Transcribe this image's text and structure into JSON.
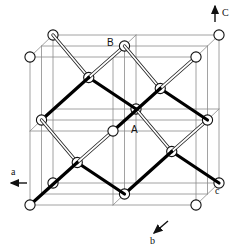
{
  "figure": {
    "kind": "crystal-structure-diagram",
    "background_color": "#ffffff",
    "atom_fill": "#ffffff",
    "atom_stroke": "#111111",
    "bond_solid_color": "#000000",
    "bond_hollow_fill": "#ffffff",
    "bond_hollow_stroke": "#222222",
    "grid_color": "#8a8a8a"
  },
  "labels": {
    "atom_a": "A",
    "atom_b": "B",
    "axis_a": "a",
    "axis_b": "b",
    "axis_c_lower": "c",
    "axis_c_upper": "C"
  },
  "axes": [
    {
      "name": "axis-c-upper",
      "label": "C",
      "direction": "up",
      "label_x": 226,
      "label_y": 15,
      "arrow": {
        "x1": 215,
        "y1": 22,
        "x2": 215,
        "y2": 6
      }
    },
    {
      "name": "axis-a",
      "label": "a",
      "direction": "left",
      "label_x": 14,
      "label_y": 172,
      "arrow": {
        "x1": 27,
        "y1": 183,
        "x2": 10,
        "y2": 183
      }
    },
    {
      "name": "axis-b",
      "label": "b",
      "direction": "down-left",
      "label_x": 152,
      "label_y": 244,
      "arrow": {
        "x1": 168,
        "y1": 222,
        "x2": 152,
        "y2": 235
      }
    },
    {
      "name": "axis-c-lower",
      "label": "c",
      "direction": "point",
      "label_x": 216,
      "label_y": 193,
      "arrow": null
    }
  ],
  "cell": {
    "note": "Oblique projection corner pixel coordinates of the outer cube",
    "front_bottom_left": [
      30,
      205
    ],
    "front_bottom_right": [
      196,
      205
    ],
    "front_top_left": [
      30,
      57
    ],
    "front_top_right": [
      196,
      57
    ],
    "depth_offset": [
      23,
      -22
    ],
    "subdivisions": 2
  },
  "atom_labels_positions": {
    "A": {
      "x": 133,
      "y": 131
    },
    "B": {
      "x": 110,
      "y": 44
    }
  },
  "counts": {
    "visible_atoms": 36,
    "bond_styles": 2
  }
}
